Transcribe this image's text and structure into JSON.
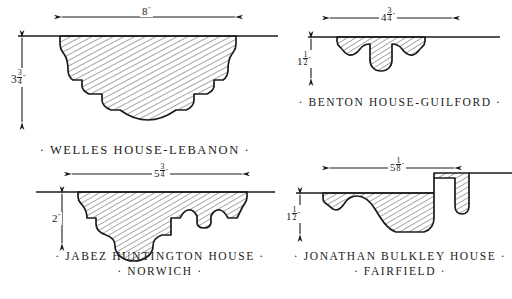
{
  "plate": {
    "title": "Colonial Door and Window Molding Profiles",
    "ink_color": "#1b1b1b",
    "paper_color": "#ffffff",
    "hatch_color": "#2a2a2a"
  },
  "figures": [
    {
      "id": "welles-house-lebanon",
      "caption_lines": [
        "· WELLES  HOUSE-LEBANON ·"
      ],
      "width_dimension": {
        "whole": "8",
        "fraction_num": "",
        "fraction_den": "",
        "unit": "″"
      },
      "height_dimension": {
        "whole": "3",
        "fraction_num": "3",
        "fraction_den": "4",
        "unit": "″"
      },
      "position": "top-left"
    },
    {
      "id": "benton-house-guilford",
      "caption_lines": [
        "· BENTON  HOUSE-GUILFORD ·"
      ],
      "width_dimension": {
        "whole": "4",
        "fraction_num": "3",
        "fraction_den": "4",
        "unit": "″"
      },
      "height_dimension": {
        "whole": "1",
        "fraction_num": "1",
        "fraction_den": "2",
        "unit": "″"
      },
      "position": "top-right"
    },
    {
      "id": "jabez-huntington-house-norwich",
      "caption_lines": [
        "· JABEZ  HUNTINGTON  HOUSE ·",
        "· NORWICH ·"
      ],
      "width_dimension": {
        "whole": "5",
        "fraction_num": "3",
        "fraction_den": "4",
        "unit": "″"
      },
      "height_dimension": {
        "whole": "2",
        "fraction_num": "",
        "fraction_den": "",
        "unit": "″"
      },
      "position": "bottom-left"
    },
    {
      "id": "jonathan-bulkley-house-fairfield",
      "caption_lines": [
        "· JONATHAN  BULKLEY  HOUSE ·",
        "· FAIRFIELD ·"
      ],
      "width_dimension": {
        "whole": "5",
        "fraction_num": "1",
        "fraction_den": "8",
        "unit": "″"
      },
      "height_dimension": {
        "whole": "1",
        "fraction_num": "1",
        "fraction_den": "2",
        "unit": "″"
      },
      "position": "bottom-right"
    }
  ]
}
